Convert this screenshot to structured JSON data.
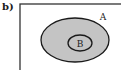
{
  "panel_label": "b)",
  "diagram": {
    "type": "venn",
    "universal_set": {
      "x": 20,
      "y": 4,
      "width": 110,
      "height": 75,
      "stroke": "#333333"
    },
    "sets": [
      {
        "name": "A",
        "cx": 75,
        "cy": 40,
        "rx": 34,
        "ry": 22,
        "fill": "#c4c4c4",
        "stroke": "#1a1a1a",
        "label_x": 103,
        "label_y": 20
      },
      {
        "name": "B",
        "cx": 80,
        "cy": 43,
        "rx": 12,
        "ry": 8,
        "fill": "#c4c4c4",
        "stroke": "#1a1a1a",
        "label_x": 80,
        "label_y": 47
      }
    ],
    "relation": "B is a subset of A"
  }
}
